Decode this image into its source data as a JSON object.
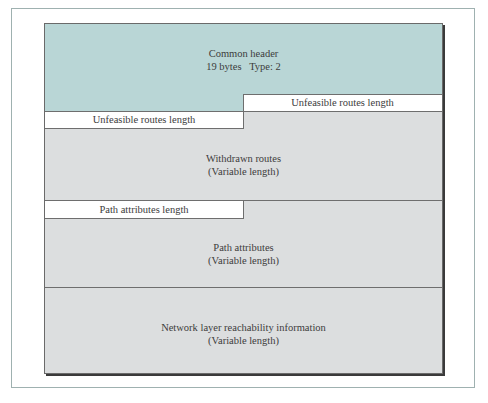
{
  "figure": {
    "colors": {
      "header_fill": "#b9d6d6",
      "body_fill": "#dcdedf",
      "field_fill": "#ffffff",
      "frame_border": "#9fb1b0",
      "line": "#6e6e6e"
    },
    "common_header": {
      "title": "Common header",
      "detail": "19 bytes   Type: 2"
    },
    "unfeasible_routes_length_right": "Unfeasible routes length",
    "unfeasible_routes_length_left": "Unfeasible routes length",
    "withdrawn_routes": {
      "title": "Withdrawn routes",
      "detail": "(Variable length)"
    },
    "path_attributes_length": "Path attributes length",
    "path_attributes": {
      "title": "Path attributes",
      "detail": "(Variable length)"
    },
    "nlri": {
      "title": "Network layer reachability information",
      "detail": "(Variable length)"
    }
  }
}
